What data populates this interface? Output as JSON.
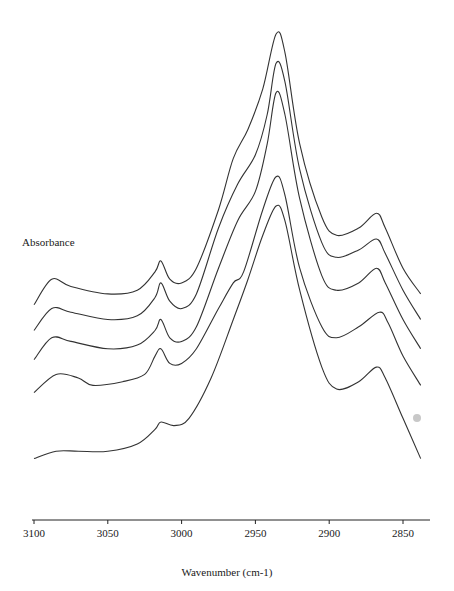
{
  "chart_data": {
    "type": "line",
    "title": "",
    "xlabel": "Wavenumber (cm-1)",
    "ylabel": "Absorbance",
    "xlim": [
      3100,
      2835
    ],
    "x_reversed": true,
    "xticks": [
      3100,
      3050,
      3000,
      2950,
      2900,
      2850
    ],
    "grid": false,
    "legend": null,
    "y_ticks_shown": false,
    "series": [
      {
        "name": "spectrum-1 (top)",
        "points": [
          [
            3100,
            0.26
          ],
          [
            3088,
            0.33
          ],
          [
            3075,
            0.31
          ],
          [
            3050,
            0.29
          ],
          [
            3030,
            0.3
          ],
          [
            3018,
            0.35
          ],
          [
            3014,
            0.38
          ],
          [
            3008,
            0.33
          ],
          [
            3000,
            0.32
          ],
          [
            2990,
            0.36
          ],
          [
            2975,
            0.52
          ],
          [
            2965,
            0.66
          ],
          [
            2955,
            0.74
          ],
          [
            2945,
            0.85
          ],
          [
            2936,
            1.0
          ],
          [
            2930,
            0.95
          ],
          [
            2920,
            0.7
          ],
          [
            2905,
            0.5
          ],
          [
            2895,
            0.45
          ],
          [
            2880,
            0.47
          ],
          [
            2868,
            0.51
          ],
          [
            2862,
            0.47
          ],
          [
            2850,
            0.36
          ],
          [
            2838,
            0.29
          ]
        ]
      },
      {
        "name": "spectrum-2",
        "points": [
          [
            3100,
            0.19
          ],
          [
            3088,
            0.25
          ],
          [
            3075,
            0.24
          ],
          [
            3050,
            0.22
          ],
          [
            3030,
            0.23
          ],
          [
            3018,
            0.28
          ],
          [
            3014,
            0.32
          ],
          [
            3008,
            0.27
          ],
          [
            3000,
            0.25
          ],
          [
            2990,
            0.29
          ],
          [
            2975,
            0.47
          ],
          [
            2962,
            0.59
          ],
          [
            2950,
            0.67
          ],
          [
            2942,
            0.78
          ],
          [
            2936,
            0.92
          ],
          [
            2930,
            0.87
          ],
          [
            2920,
            0.63
          ],
          [
            2905,
            0.43
          ],
          [
            2895,
            0.39
          ],
          [
            2880,
            0.41
          ],
          [
            2868,
            0.44
          ],
          [
            2862,
            0.4
          ],
          [
            2850,
            0.3
          ],
          [
            2838,
            0.22
          ]
        ]
      },
      {
        "name": "spectrum-3",
        "points": [
          [
            3100,
            0.11
          ],
          [
            3088,
            0.17
          ],
          [
            3075,
            0.16
          ],
          [
            3050,
            0.14
          ],
          [
            3030,
            0.15
          ],
          [
            3018,
            0.19
          ],
          [
            3014,
            0.22
          ],
          [
            3008,
            0.17
          ],
          [
            3000,
            0.16
          ],
          [
            2990,
            0.2
          ],
          [
            2975,
            0.36
          ],
          [
            2962,
            0.49
          ],
          [
            2950,
            0.57
          ],
          [
            2942,
            0.7
          ],
          [
            2936,
            0.84
          ],
          [
            2930,
            0.78
          ],
          [
            2920,
            0.55
          ],
          [
            2905,
            0.34
          ],
          [
            2895,
            0.3
          ],
          [
            2880,
            0.32
          ],
          [
            2868,
            0.36
          ],
          [
            2862,
            0.32
          ],
          [
            2850,
            0.22
          ],
          [
            2838,
            0.14
          ]
        ]
      },
      {
        "name": "spectrum-4",
        "points": [
          [
            3100,
            0.02
          ],
          [
            3085,
            0.07
          ],
          [
            3070,
            0.06
          ],
          [
            3060,
            0.04
          ],
          [
            3040,
            0.05
          ],
          [
            3025,
            0.07
          ],
          [
            3018,
            0.12
          ],
          [
            3014,
            0.14
          ],
          [
            3008,
            0.1
          ],
          [
            3000,
            0.1
          ],
          [
            2990,
            0.14
          ],
          [
            2975,
            0.25
          ],
          [
            2965,
            0.32
          ],
          [
            2958,
            0.35
          ],
          [
            2945,
            0.52
          ],
          [
            2936,
            0.61
          ],
          [
            2930,
            0.56
          ],
          [
            2920,
            0.36
          ],
          [
            2905,
            0.2
          ],
          [
            2895,
            0.17
          ],
          [
            2880,
            0.2
          ],
          [
            2866,
            0.24
          ],
          [
            2860,
            0.21
          ],
          [
            2850,
            0.12
          ],
          [
            2838,
            0.04
          ]
        ]
      },
      {
        "name": "spectrum-5 (bottom)",
        "points": [
          [
            3100,
            -0.16
          ],
          [
            3085,
            -0.14
          ],
          [
            3070,
            -0.14
          ],
          [
            3050,
            -0.14
          ],
          [
            3030,
            -0.12
          ],
          [
            3018,
            -0.08
          ],
          [
            3014,
            -0.06
          ],
          [
            3005,
            -0.07
          ],
          [
            2995,
            -0.05
          ],
          [
            2980,
            0.06
          ],
          [
            2965,
            0.22
          ],
          [
            2955,
            0.33
          ],
          [
            2945,
            0.45
          ],
          [
            2936,
            0.53
          ],
          [
            2930,
            0.49
          ],
          [
            2920,
            0.3
          ],
          [
            2905,
            0.09
          ],
          [
            2895,
            0.03
          ],
          [
            2880,
            0.05
          ],
          [
            2868,
            0.09
          ],
          [
            2862,
            0.06
          ],
          [
            2850,
            -0.05
          ],
          [
            2838,
            -0.16
          ]
        ]
      }
    ]
  },
  "axis": {
    "xlabel": "Wavenumber (cm-1)",
    "ylabel": "Absorbance",
    "tick_labels": [
      "3100",
      "3050",
      "3000",
      "2950",
      "2900",
      "2850"
    ]
  },
  "colors": {
    "line": "#333333",
    "axis": "#222222",
    "marker_dot": "#c8c8c8"
  }
}
